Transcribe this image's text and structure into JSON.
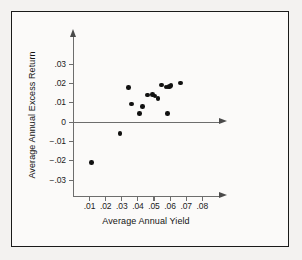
{
  "chart_data": {
    "type": "scatter",
    "title": "",
    "xlabel": "Average Annual Yield",
    "ylabel": "Average Annual Excess Return",
    "xlim": [
      0,
      0.088
    ],
    "ylim": [
      -0.038,
      0.038
    ],
    "grid": false,
    "legend": null,
    "x_ticks": [
      ".01",
      ".02",
      ".03",
      ".04",
      ".05",
      ".06",
      ".07",
      ".08"
    ],
    "x_tick_values": [
      0.01,
      0.02,
      0.03,
      0.04,
      0.05,
      0.06,
      0.07,
      0.08
    ],
    "y_ticks": [
      ".03",
      ".02",
      ".01",
      "0",
      "−.01",
      "−.02",
      "−.03"
    ],
    "y_tick_values": [
      0.03,
      0.02,
      0.01,
      0,
      -0.01,
      -0.02,
      -0.03
    ],
    "points": [
      {
        "x": 0.011,
        "y": -0.021
      },
      {
        "x": 0.029,
        "y": -0.006
      },
      {
        "x": 0.034,
        "y": 0.018
      },
      {
        "x": 0.036,
        "y": 0.0095
      },
      {
        "x": 0.041,
        "y": 0.0045
      },
      {
        "x": 0.043,
        "y": 0.008
      },
      {
        "x": 0.046,
        "y": 0.014
      },
      {
        "x": 0.049,
        "y": 0.0143
      },
      {
        "x": 0.0505,
        "y": 0.0135
      },
      {
        "x": 0.0525,
        "y": 0.0122
      },
      {
        "x": 0.0545,
        "y": 0.0193
      },
      {
        "x": 0.0575,
        "y": 0.0182
      },
      {
        "x": 0.0588,
        "y": 0.0183
      },
      {
        "x": 0.0598,
        "y": 0.0185
      },
      {
        "x": 0.0605,
        "y": 0.019
      },
      {
        "x": 0.0663,
        "y": 0.0204
      },
      {
        "x": 0.0585,
        "y": 0.0045
      }
    ],
    "point_color": "#111111",
    "axis_color": "#6d6d6d"
  }
}
